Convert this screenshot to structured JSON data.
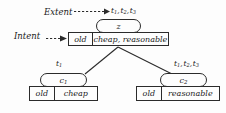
{
  "diagram": {
    "background_color": "#fdfdfd",
    "line_color": "#2b2b2b",
    "annotations": {
      "extent_label": "Extent",
      "intent_label": "Intent",
      "extent_arrow": "dashed-arrow-right",
      "intent_arrow": "dashed-arrow-right"
    },
    "nodes": [
      {
        "id": "root",
        "concept_name": "z",
        "extent_tag": "t1, t2, t3",
        "extent_tag_parts": [
          "t",
          "1",
          "t",
          "2",
          "t",
          "3"
        ],
        "intent_left": "old",
        "intent_right": "cheap, reasonable"
      },
      {
        "id": "c1",
        "concept_name": "c1",
        "concept_base": "c",
        "concept_sub": "1",
        "extent_tag_base": "t",
        "extent_tag_sub": "1",
        "intent_left": "old",
        "intent_right": "cheap"
      },
      {
        "id": "c2",
        "concept_name": "c2",
        "concept_base": "c",
        "concept_sub": "2",
        "extent_tag": "t1, t2, t3",
        "intent_left": "old",
        "intent_right": "reasonable"
      }
    ],
    "edges": [
      {
        "from": "root",
        "to": "c1"
      },
      {
        "from": "root",
        "to": "c2"
      }
    ]
  }
}
